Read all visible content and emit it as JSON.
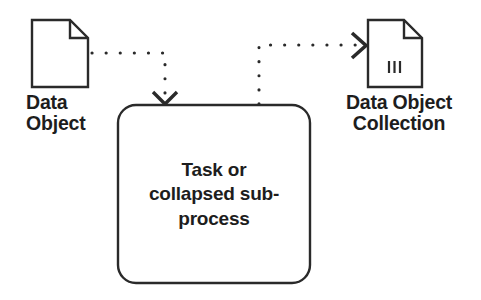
{
  "diagram": {
    "type": "bpmn-data-association",
    "background_color": "#ffffff",
    "stroke_color": "#2a2a2a",
    "text_color": "#1d1d1d",
    "nodes": [
      {
        "id": "data-object",
        "kind": "data-object",
        "label": "Data\nObject",
        "label_lines": [
          "Data",
          "Object"
        ],
        "x": 32,
        "y": 20,
        "width": 56,
        "height": 67,
        "fold_size": 18,
        "is_collection": false
      },
      {
        "id": "task",
        "kind": "task-or-collapsed-subprocess",
        "label": "Task or\ncollapsed sub-\nprocess",
        "label_lines": [
          "Task or",
          "collapsed sub-",
          "process"
        ],
        "x": 118,
        "y": 105,
        "width": 192,
        "height": 178,
        "corner_radius": 18
      },
      {
        "id": "data-object-collection",
        "kind": "data-object",
        "label": "Data Object\nCollection",
        "label_lines": [
          "Data Object",
          "Collection"
        ],
        "x": 368,
        "y": 20,
        "width": 54,
        "height": 67,
        "fold_size": 18,
        "is_collection": true,
        "collection_marker_bars": 3
      }
    ],
    "edges": [
      {
        "id": "data-input-association",
        "kind": "data-association",
        "style": "dotted",
        "from": "data-object",
        "to": "task",
        "arrowhead": "open-v-down",
        "path_points": [
          [
            90,
            53
          ],
          [
            165,
            53
          ],
          [
            165,
            100
          ]
        ]
      },
      {
        "id": "data-output-association",
        "kind": "data-association",
        "style": "dotted",
        "from": "task",
        "to": "data-object-collection",
        "arrowhead": "open-v-right",
        "path_points": [
          [
            259,
            105
          ],
          [
            259,
            45
          ],
          [
            362,
            45
          ]
        ]
      }
    ]
  }
}
